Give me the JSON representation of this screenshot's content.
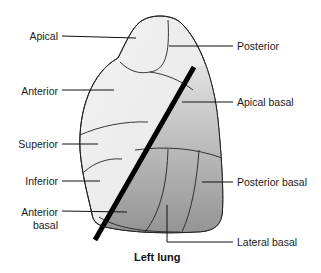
{
  "diagram": {
    "title": "Left lung",
    "labels": {
      "apical": "Apical",
      "anterior": "Anterior",
      "superior": "Superior",
      "inferior": "Inferior",
      "anterior_basal_1": "Anterior",
      "anterior_basal_2": "basal",
      "posterior": "Posterior",
      "apical_basal": "Apical basal",
      "posterior_basal": "Posterior basal",
      "lateral_basal": "Lateral basal"
    },
    "colors": {
      "upper_lobe": "#ececec",
      "lower_lobe_light": "#d8d8d8",
      "lower_lobe_dark": "#8e8e8e",
      "fissure": "#000000",
      "outline": "#222222"
    }
  }
}
